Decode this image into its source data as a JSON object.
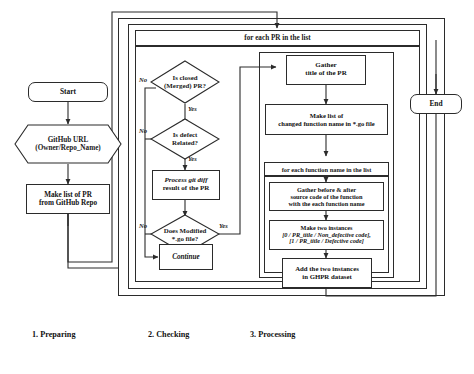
{
  "figure": {
    "type": "flowchart",
    "captions": [
      {
        "id": "prep",
        "label": "1. Preparing"
      },
      {
        "id": "check",
        "label": "2. Checking"
      },
      {
        "id": "proc",
        "label": "3. Processing"
      }
    ]
  },
  "nodes": {
    "start": {
      "label": "Start"
    },
    "github_url": {
      "line1": "GitHub URL",
      "line2": "(Owner/Repo_Name)"
    },
    "make_list_pr": {
      "line1": "Make list of PR",
      "line2": "from GitHub Repo"
    },
    "end": {
      "label": "End"
    },
    "loop_pr": {
      "label": "for each PR in the list"
    },
    "is_closed": {
      "line1": "Is closed",
      "line2": "(Merged) PR?"
    },
    "is_defect": {
      "line1": "Is defect",
      "line2": "Related?"
    },
    "process_diff": {
      "line1": "Process git diff",
      "line2": "result of the PR"
    },
    "does_modified": {
      "line1": "Does Modified",
      "line2": "*.go file?"
    },
    "continue": {
      "label": "Continue"
    },
    "gather_title": {
      "line1": "Gather",
      "line2": "title of the PR"
    },
    "make_list_fn": {
      "line1": "Make list of",
      "line2": "changed function name in *.go file"
    },
    "loop_fn": {
      "label": "for each function name in the list"
    },
    "gather_src": {
      "line1": "Gather before & after",
      "line2": "source code of the function",
      "line3": "with the each function name"
    },
    "make_two": {
      "line1": "Make two instances",
      "line2": "[0 / PR_title / Non_defective code],",
      "line3": "[1 / PR_title / Defective code]"
    },
    "add_two": {
      "line1": "Add the two instances",
      "line2": "in GHPR dataset"
    }
  },
  "edge_labels": {
    "no_closed": "No",
    "yes_closed": "Yes",
    "no_defect": "No",
    "yes_defect": "Yes",
    "no_go": "No",
    "yes_go": "Yes"
  },
  "colors": {
    "stroke": "#2b2b2b",
    "text": "#111111",
    "background": "#ffffff"
  }
}
